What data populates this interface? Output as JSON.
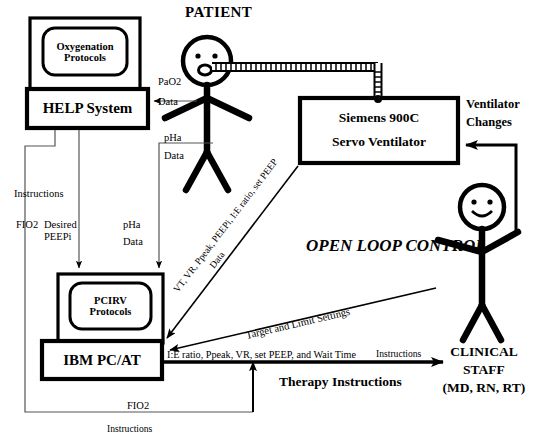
{
  "diagram": {
    "title_text": "OPEN LOOP CONTROL",
    "nodes": {
      "help_monitor": "Oxygenation\nProtocols",
      "help_system": "HELP System",
      "pcirv_monitor": "PCIRV\nProtocols",
      "ibm_pc": "IBM PC/AT",
      "ventilator": "Siemens 900C\nServo Ventilator",
      "ventilator_line1": "Siemens 900C",
      "ventilator_line2": "Servo Ventilator",
      "patient": "PATIENT",
      "clinical_staff_line1": "CLINICAL",
      "clinical_staff_line2": "STAFF",
      "clinical_staff_line3": "(MD, RN, RT)"
    },
    "edge_labels": {
      "pao2": "PaO2",
      "pao2_data": "Data",
      "pha": "pHa",
      "pha_data": "Data",
      "pha_left": "pHa",
      "pha_left_data": "Data",
      "instructions_top": "Instructions",
      "fio2_left": "FIO2",
      "desired_peepi": "Desired\n  PEEPi",
      "vent_changes": "Ventilator\nChanges",
      "vent_changes_line1": "Ventilator",
      "vent_changes_line2": "Changes",
      "diag_data_main": "VT, VR, Ppeak, PEEPi, I:E ratio, set PEEP",
      "diag_data_word": "Data",
      "target_limits": "Target and Limit Settings",
      "settings_list": "I:E ratio, Ppeak, VR, set PEEP, and Wait Time",
      "settings_instructions": "Instructions",
      "therapy_instructions": "Therapy Instructions",
      "fio2_bottom": "FIO2",
      "instructions_bottom": "Instructions"
    },
    "colors": {
      "stroke": "#000000",
      "background": "#ffffff",
      "thin_stroke": "#2a2a2a"
    }
  }
}
